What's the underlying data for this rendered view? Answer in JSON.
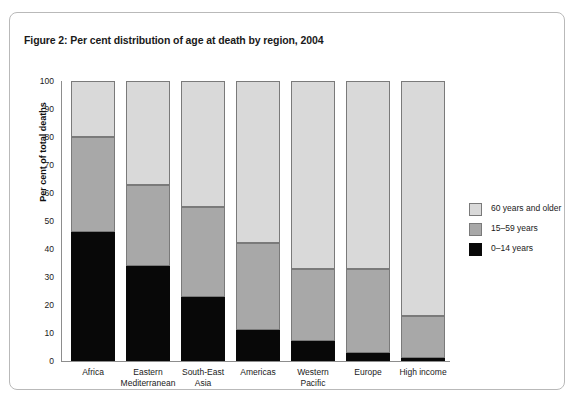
{
  "figure": {
    "title": "Figure 2: Per cent distribution of age at death by region, 2004"
  },
  "chart_data": {
    "type": "bar",
    "subtype": "stacked-bar-100-percent",
    "title": "Figure 2: Per cent distribution of age at death by region, 2004",
    "xlabel": "",
    "ylabel": "Per cent of total deaths",
    "ylim": [
      0,
      100
    ],
    "ytick_step": 10,
    "yticks": [
      0,
      10,
      20,
      30,
      40,
      50,
      60,
      70,
      80,
      90,
      100
    ],
    "grid": false,
    "legend_position": "right",
    "categories": [
      "Africa",
      "Eastern Mediterranean",
      "South-East Asia",
      "Americas",
      "Western Pacific",
      "Europe",
      "High income"
    ],
    "category_lines": [
      [
        "Africa"
      ],
      [
        "Eastern",
        "Mediterranean"
      ],
      [
        "South-East",
        "Asia"
      ],
      [
        "Americas"
      ],
      [
        "Western",
        "Pacific"
      ],
      [
        "Europe"
      ],
      [
        "High income"
      ]
    ],
    "series": [
      {
        "name": "0–14 years",
        "color": "#080808",
        "values": [
          46,
          34,
          23,
          11,
          7,
          3,
          1
        ]
      },
      {
        "name": "15–59 years",
        "color": "#a8a8a8",
        "values": [
          34,
          29,
          32,
          31,
          26,
          30,
          15
        ]
      },
      {
        "name": "60 years and older",
        "color": "#d9d9d9",
        "values": [
          20,
          37,
          45,
          58,
          67,
          67,
          84
        ]
      }
    ],
    "cumulative_tops": {
      "child": [
        46,
        34,
        23,
        11,
        7,
        3,
        1
      ],
      "child_plus_adult": [
        80,
        63,
        55,
        42,
        33,
        33,
        16
      ],
      "total": [
        100,
        100,
        100,
        100,
        100,
        100,
        100
      ]
    },
    "legend": [
      {
        "label": "60 years and older",
        "color": "#d9d9d9"
      },
      {
        "label": "15–59 years",
        "color": "#a8a8a8"
      },
      {
        "label": "0–14 years",
        "color": "#080808"
      }
    ]
  }
}
